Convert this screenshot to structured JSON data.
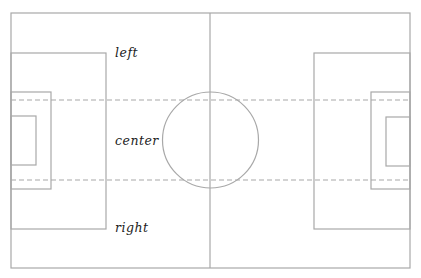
{
  "diagram": {
    "type": "soccer-field",
    "colors": {
      "lines": "#a8a8a8",
      "labels": "#222222",
      "background": "#ffffff"
    },
    "labels": [
      {
        "id": "left",
        "text": "left",
        "x": 115,
        "y": 57
      },
      {
        "id": "center",
        "text": "center",
        "x": 115,
        "y": 145
      },
      {
        "id": "right",
        "text": "right",
        "x": 115,
        "y": 232
      }
    ]
  }
}
